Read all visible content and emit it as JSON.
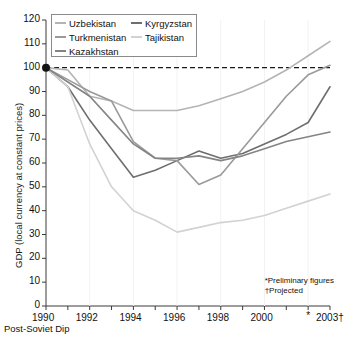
{
  "axes": {
    "ylabel": "GDP (local currency at constant prices)",
    "yticks": [
      0,
      10,
      20,
      30,
      40,
      50,
      60,
      70,
      80,
      90,
      100,
      110,
      120
    ],
    "ylim": [
      0,
      120
    ],
    "xlim": [
      1990,
      2003
    ],
    "xticks": [
      1990,
      1991,
      1992,
      1993,
      1994,
      1995,
      1996,
      1997,
      1998,
      1999,
      2000,
      2001,
      2002,
      2003
    ],
    "xticklabels": [
      "1990",
      "",
      "1992",
      "",
      "1994",
      "",
      "1996",
      "",
      "1998",
      "",
      "2000",
      "",
      "*",
      "2003†"
    ],
    "caption": "Post-Soviet Dip",
    "reference_line": 100
  },
  "footnotes": {
    "line1": "*Preliminary figures",
    "line2": "†Projected"
  },
  "legend": {
    "entries": [
      {
        "label": "Uzbekistan",
        "color": "#b4b4b4"
      },
      {
        "label": "Kyrgyzstan",
        "color": "#6e6e6e"
      },
      {
        "label": "Turkmenistan",
        "color": "#9a9a9a"
      },
      {
        "label": "Tajikistan",
        "color": "#d2d2d2"
      },
      {
        "label": "Kazakhstan",
        "color": "#848484"
      }
    ]
  },
  "chart_data": {
    "type": "line",
    "title": "",
    "subtitle": "",
    "xlabel": "Post-Soviet Dip",
    "ylabel": "GDP (local currency at constant prices)",
    "x": [
      1990,
      1991,
      1992,
      1993,
      1994,
      1995,
      1996,
      1997,
      1998,
      1999,
      2000,
      2001,
      2002,
      2003
    ],
    "xlim": [
      1990,
      2003
    ],
    "ylim": [
      0,
      120
    ],
    "grid": false,
    "legend_position": "top-left",
    "reference_line": {
      "value": 100,
      "style": "dashed"
    },
    "start_marker": {
      "x": 1990,
      "y": 100
    },
    "series": [
      {
        "name": "Uzbekistan",
        "color": "#b4b4b4",
        "values": [
          100,
          99,
          88,
          86,
          82,
          82,
          82,
          84,
          87,
          90,
          94,
          99,
          105,
          111
        ]
      },
      {
        "name": "Kyrgyzstan",
        "color": "#6e6e6e",
        "values": [
          100,
          92,
          78,
          66,
          54,
          57,
          61,
          65,
          62,
          64,
          68,
          72,
          77,
          92
        ]
      },
      {
        "name": "Turkmenistan",
        "color": "#9a9a9a",
        "values": [
          100,
          95,
          90,
          86,
          69,
          62,
          61,
          51,
          55,
          66,
          77,
          88,
          97,
          101
        ]
      },
      {
        "name": "Tajikistan",
        "color": "#d2d2d2",
        "values": [
          100,
          92,
          68,
          50,
          40,
          36,
          31,
          33,
          35,
          36,
          38,
          41,
          44,
          47
        ]
      },
      {
        "name": "Kazakhstan",
        "color": "#848484",
        "values": [
          100,
          94,
          88,
          78,
          68,
          62,
          62,
          63,
          61,
          63,
          66,
          69,
          71,
          73
        ]
      }
    ]
  }
}
